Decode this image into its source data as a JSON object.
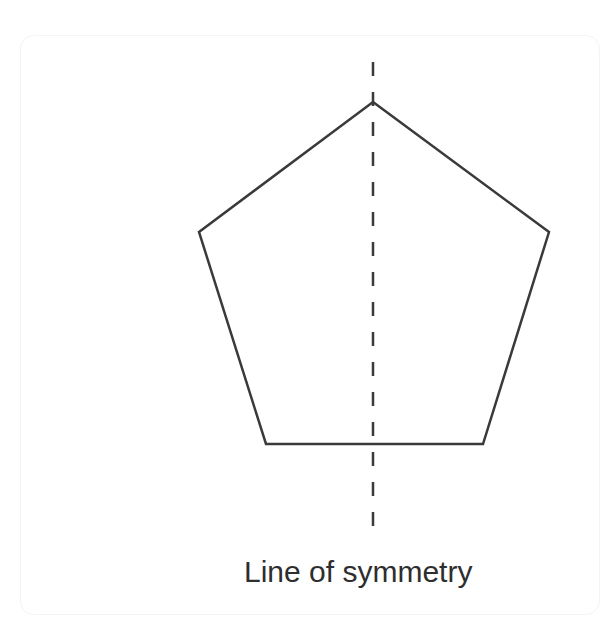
{
  "diagram": {
    "type": "geometry",
    "shape": "regular-pentagon",
    "stroke_color": "#3a3a3a",
    "background": "#ffffff",
    "vertices": [
      {
        "name": "top",
        "x": 373,
        "y": 102
      },
      {
        "name": "right",
        "x": 549,
        "y": 232
      },
      {
        "name": "bottom-right",
        "x": 483,
        "y": 444
      },
      {
        "name": "bottom-left",
        "x": 266,
        "y": 444
      },
      {
        "name": "left",
        "x": 199,
        "y": 232
      }
    ],
    "symmetry_line": {
      "style": "dashed",
      "orientation": "vertical",
      "x": 373,
      "y_start": 62,
      "y_end": 538
    },
    "caption": "Line of symmetry"
  }
}
